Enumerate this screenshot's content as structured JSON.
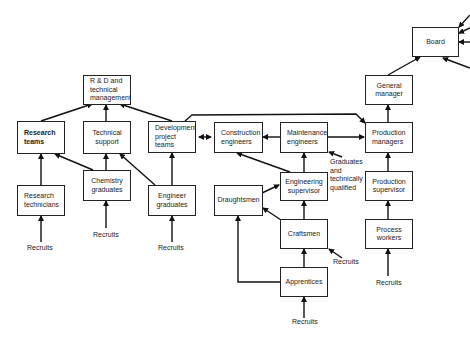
{
  "diagram": {
    "nodes": {
      "rd_management": "R & D and technical management",
      "research_teams": "Research teams",
      "technical_support": "Technical support",
      "development_project_teams": "Development project teams",
      "research_technicians": "Research technicians",
      "chemistry_graduates": "Chemistry graduates",
      "engineer_graduates": "Engineer graduates",
      "construction_engineers": "Construction engineers",
      "maintenance_engineers": "Maintenance engineers",
      "engineering_supervisor": "Engineering supervisor",
      "draughtsmen": "Draughtsmen",
      "craftsmen": "Craftsmen",
      "apprentices": "Apprentices",
      "production_managers": "Production managers",
      "production_supervisor": "Production supervisor",
      "process_workers": "Process workers",
      "general_manager": "General manager",
      "board": "Board"
    },
    "labels": {
      "recruits_research_technicians": "Recruits",
      "recruits_chemistry_graduates": "Recruits",
      "recruits_engineer_graduates": "Recruits",
      "recruits_craftsmen": "Recruits",
      "recruits_apprentices": "Recruits",
      "recruits_process_workers": "Recruits",
      "graduates_qualified": "Graduates\nand\ntechnically\nqualified"
    },
    "edges": [
      [
        "research_teams",
        "rd_management"
      ],
      [
        "technical_support",
        "rd_management"
      ],
      [
        "development_project_teams",
        "rd_management"
      ],
      [
        "research_technicians",
        "research_teams"
      ],
      [
        "chemistry_graduates",
        "research_teams"
      ],
      [
        "chemistry_graduates",
        "technical_support"
      ],
      [
        "engineer_graduates",
        "technical_support"
      ],
      [
        "engineer_graduates",
        "development_project_teams"
      ],
      [
        "development_project_teams",
        "construction_engineers"
      ],
      [
        "construction_engineers",
        "development_project_teams"
      ],
      [
        "maintenance_engineers",
        "construction_engineers"
      ],
      [
        "maintenance_engineers",
        "production_managers"
      ],
      [
        "development_project_teams",
        "production_managers"
      ],
      [
        "engineering_supervisor",
        "maintenance_engineers"
      ],
      [
        "engineering_supervisor",
        "construction_engineers"
      ],
      [
        "draughtsmen",
        "engineering_supervisor"
      ],
      [
        "craftsmen",
        "engineering_supervisor"
      ],
      [
        "craftsmen",
        "draughtsmen"
      ],
      [
        "apprentices",
        "craftsmen"
      ],
      [
        "apprentices",
        "draughtsmen"
      ],
      [
        "process_workers",
        "production_supervisor"
      ],
      [
        "production_supervisor",
        "production_managers"
      ],
      [
        "production_managers",
        "general_manager"
      ],
      [
        "general_manager",
        "board"
      ]
    ]
  }
}
